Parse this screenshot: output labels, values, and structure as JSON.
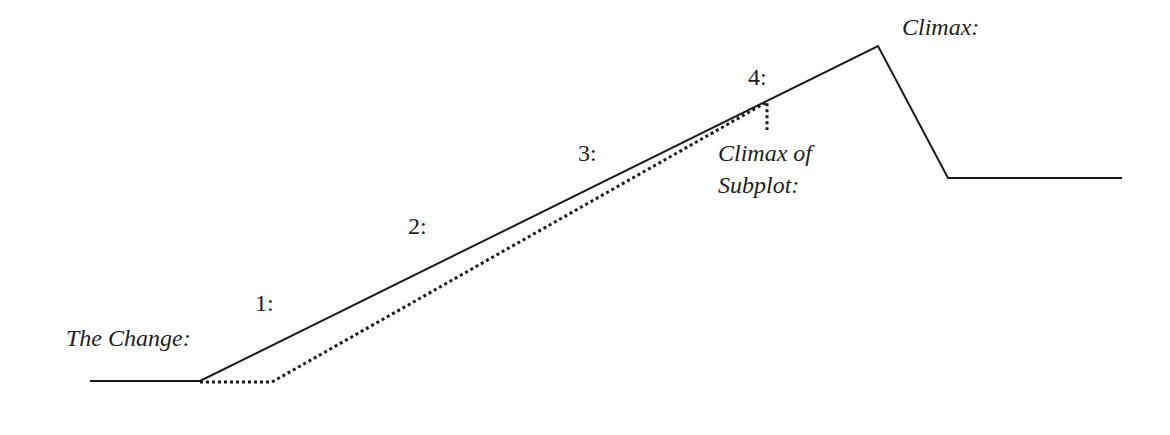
{
  "diagram": {
    "type": "plot-structure",
    "labels": {
      "the_change": "The Change:",
      "step1": "1:",
      "step2": "2:",
      "step3": "3:",
      "step4": "4:",
      "climax": "Climax:",
      "subplot_climax_line1": "Climax of",
      "subplot_climax_line2": "Subplot:"
    },
    "main_plot_line": {
      "style": "solid",
      "color": "#1a1a1a",
      "points": [
        [
          90,
          381
        ],
        [
          200,
          381
        ],
        [
          878,
          46
        ],
        [
          948,
          178
        ],
        [
          1122,
          178
        ]
      ]
    },
    "subplot_line": {
      "style": "dotted",
      "color": "#1a1a1a",
      "points": [
        [
          200,
          381
        ],
        [
          272,
          381
        ],
        [
          767,
          102
        ],
        [
          767,
          130
        ]
      ]
    }
  }
}
